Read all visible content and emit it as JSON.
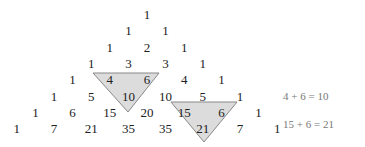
{
  "rows": [
    [
      "1"
    ],
    [
      "1",
      "1"
    ],
    [
      "1",
      "2",
      "1"
    ],
    [
      "1",
      "3",
      "3",
      "1"
    ],
    [
      "1",
      "4",
      "6",
      "4",
      "1"
    ],
    [
      "1",
      "5",
      "10",
      "10",
      "5",
      "1"
    ],
    [
      "1",
      "6",
      "15",
      "20",
      "15",
      "6",
      "1"
    ],
    [
      "1",
      "7",
      "21",
      "35",
      "35",
      "21",
      "7",
      "1"
    ]
  ],
  "highlights": [
    {
      "cells": [
        "4",
        "6",
        "10"
      ],
      "equation": "4 + 6 = 10"
    },
    {
      "cells": [
        "15",
        "6",
        "21"
      ],
      "equation": "15 + 6 = 21"
    }
  ],
  "colors": {
    "highlight_fill": "#dcdcdc",
    "highlight_stroke": "#888888"
  }
}
